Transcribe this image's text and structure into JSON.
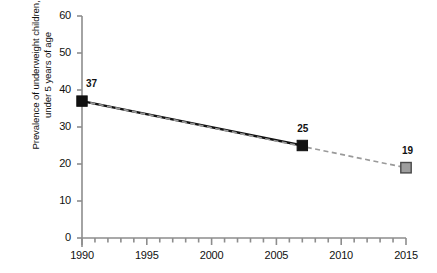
{
  "chart_data": {
    "type": "line",
    "title": "",
    "xlabel": "",
    "ylabel": "Prevalence of underweight children, under 5 years of age",
    "ylabel_line1": "Prevalence of underweight children,",
    "ylabel_line2": "under 5 years of age",
    "xlim": [
      1990,
      2015
    ],
    "ylim": [
      0,
      60
    ],
    "grid": false,
    "legend": "none",
    "x_ticks_major": [
      1990,
      1995,
      2000,
      2005,
      2010,
      2015
    ],
    "x_tick_labels": [
      "1990",
      "1995",
      "2000",
      "2005",
      "2010",
      "2015"
    ],
    "x_minor_tick_interval": 1,
    "y_ticks": [
      0,
      10,
      20,
      30,
      40,
      50,
      60
    ],
    "y_tick_labels": [
      "0",
      "10",
      "20",
      "30",
      "40",
      "50",
      "60"
    ],
    "series": [
      {
        "name": "observed",
        "style": "solid",
        "color": "#111111",
        "marker": "square-filled",
        "marker_color": "#111111",
        "x": [
          1990,
          2007
        ],
        "values": [
          37,
          25
        ],
        "point_labels": [
          "37",
          "25"
        ]
      },
      {
        "name": "target-trend",
        "style": "dashed",
        "color": "#9a9a9a",
        "marker": "square-filled",
        "marker_color": "#9a9a9a",
        "x": [
          1990,
          2015
        ],
        "values": [
          37,
          19
        ],
        "point_labels": [
          "",
          "19"
        ],
        "marker_on": [
          2015
        ]
      }
    ],
    "annotations": [
      {
        "text": "37",
        "x": 1990,
        "y": 37
      },
      {
        "text": "25",
        "x": 2007,
        "y": 25
      },
      {
        "text": "19",
        "x": 2015,
        "y": 19
      }
    ],
    "colors": {
      "axis": "#8d8d8d",
      "series_solid": "#111111",
      "series_dashed": "#9a9a9a",
      "marker_projected_fill": "#9e9e9e",
      "marker_projected_stroke": "#4a4a4a",
      "background": "#ffffff",
      "text": "#111111"
    }
  }
}
